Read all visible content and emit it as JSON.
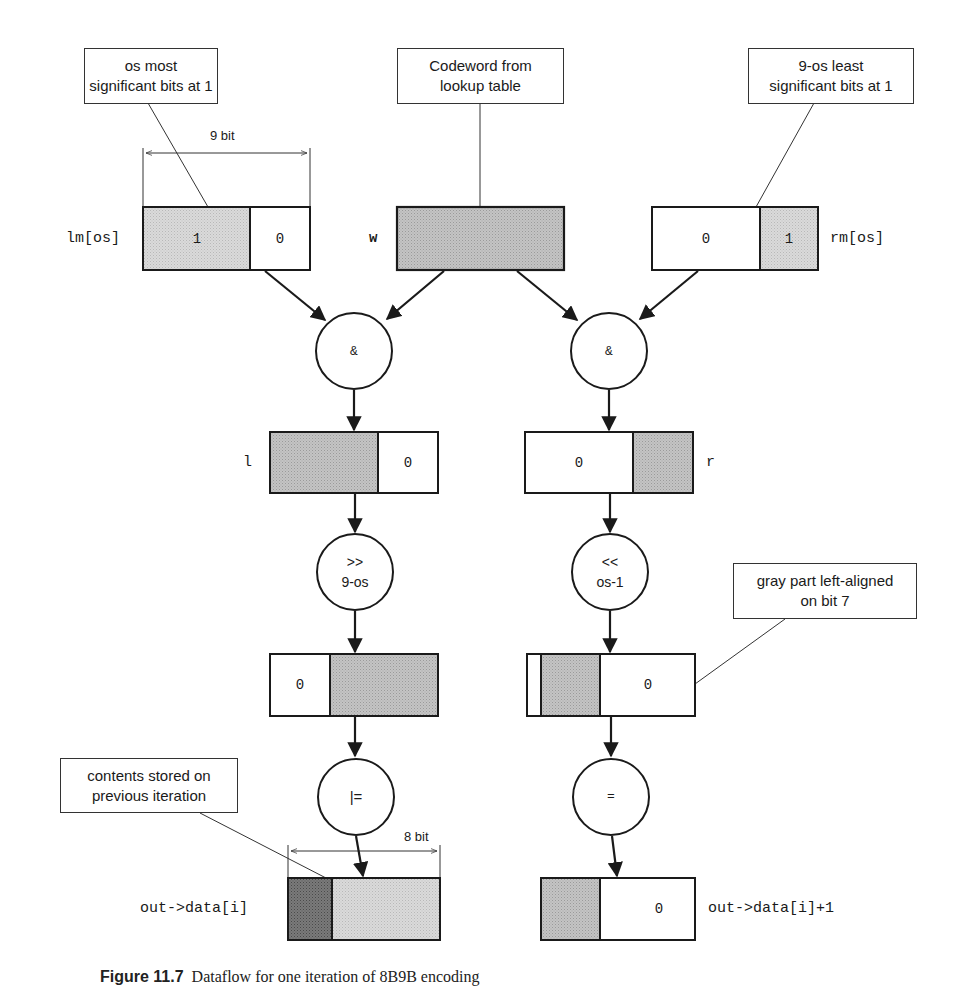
{
  "callouts": {
    "left": "os most\nsignificant bits at 1",
    "center": "Codeword from\nlookup table",
    "right": "9-os least\nsignificant bits at 1",
    "gray_part": "gray part left-aligned\non bit 7",
    "contents": "contents stored on\nprevious iteration"
  },
  "dimensions": {
    "top_width": "9 bit",
    "bottom_width": "8 bit"
  },
  "registers": {
    "lm": {
      "label": "lm[os]",
      "cells": [
        "1",
        "0"
      ]
    },
    "w": {
      "label": "w"
    },
    "rm": {
      "label": "rm[os]",
      "cells": [
        "0",
        "1"
      ]
    },
    "l": {
      "label": "l",
      "cells": [
        "0"
      ]
    },
    "r": {
      "label": "r",
      "cells": [
        "0"
      ]
    },
    "shifted_l": {
      "cells": [
        "0"
      ]
    },
    "shifted_r": {
      "cells": [
        "0"
      ]
    },
    "out_i": {
      "label": "out->data[i]"
    },
    "out_i1": {
      "label": "out->data[i]+1",
      "cells": [
        "0"
      ]
    }
  },
  "operators": {
    "and_left": "&",
    "and_right": "&",
    "shift_right": ">>\n9-os",
    "shift_left": "<<\nos-1",
    "or_assign": "|=",
    "assign": "="
  },
  "colors": {
    "gray_light": "#d6d6d6",
    "gray_medium": "#bdbdbd",
    "gray_dark": "#7d7d7d",
    "stroke": "#1a1a1a"
  },
  "caption": {
    "label": "Figure 11.7",
    "text": "Dataflow for one iteration of 8B9B encoding"
  }
}
